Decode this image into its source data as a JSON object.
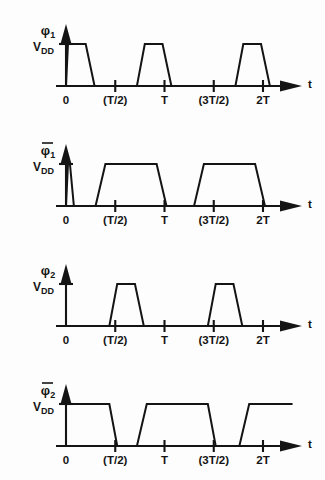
{
  "figure": {
    "stroke_color": "#141414",
    "background_color": "#fdfdfd"
  },
  "axis": {
    "time_axis_label": "t",
    "amplitude_label_main": "V",
    "amplitude_label_sub": "DD",
    "tick_labels": [
      "0",
      "(T/2)",
      "T",
      "(3T/2)",
      "2T"
    ],
    "tick_values": [
      0,
      0.5,
      1.0,
      1.5,
      2.0
    ],
    "x_min": 0,
    "x_max": 2.35,
    "y_min": 0,
    "y_max": 1
  },
  "chart_data": {
    "type": "line",
    "xlabel": "t",
    "ylabel": "V_DD",
    "x_tick_labels": [
      "0",
      "(T/2)",
      "T",
      "(3T/2)",
      "2T"
    ],
    "x_ticks": [
      0,
      0.5,
      1.0,
      1.5,
      2.0
    ],
    "xlim": [
      0,
      2.35
    ],
    "ylim": [
      0,
      1
    ],
    "grid": false,
    "legend": "none",
    "note": "Values are normalized: time in units of T, amplitude 0 = ground, 1 = V_DD. Waveforms are trapezoidal with finite rise and fall times.",
    "series": [
      {
        "name": "phi_1",
        "label": "φ",
        "subscript": "1",
        "overbar": false,
        "points": [
          [
            0.0,
            0.0
          ],
          [
            0.02,
            1.0
          ],
          [
            0.2,
            1.0
          ],
          [
            0.29,
            0.0
          ],
          [
            0.72,
            0.0
          ],
          [
            0.8,
            1.0
          ],
          [
            0.98,
            1.0
          ],
          [
            1.07,
            0.0
          ],
          [
            1.72,
            0.0
          ],
          [
            1.8,
            1.0
          ],
          [
            1.98,
            1.0
          ],
          [
            2.07,
            0.0
          ],
          [
            2.35,
            0.0
          ]
        ]
      },
      {
        "name": "phi_1_bar",
        "label": "φ",
        "subscript": "1",
        "overbar": true,
        "points": [
          [
            0.0,
            0.0
          ],
          [
            0.02,
            1.0
          ],
          [
            0.04,
            1.0
          ],
          [
            0.08,
            0.0
          ],
          [
            0.3,
            0.0
          ],
          [
            0.4,
            1.0
          ],
          [
            0.92,
            1.0
          ],
          [
            1.02,
            0.0
          ],
          [
            1.3,
            0.0
          ],
          [
            1.4,
            1.0
          ],
          [
            1.92,
            1.0
          ],
          [
            2.02,
            0.0
          ],
          [
            2.35,
            0.0
          ]
        ]
      },
      {
        "name": "phi_2",
        "label": "φ",
        "subscript": "2",
        "overbar": false,
        "points": [
          [
            0.0,
            0.0
          ],
          [
            0.44,
            0.0
          ],
          [
            0.52,
            1.0
          ],
          [
            0.7,
            1.0
          ],
          [
            0.79,
            0.0
          ],
          [
            1.44,
            0.0
          ],
          [
            1.52,
            1.0
          ],
          [
            1.7,
            1.0
          ],
          [
            1.79,
            0.0
          ],
          [
            2.35,
            0.0
          ]
        ]
      },
      {
        "name": "phi_2_bar",
        "label": "φ",
        "subscript": "2",
        "overbar": true,
        "points": [
          [
            0.0,
            1.0
          ],
          [
            0.44,
            1.0
          ],
          [
            0.52,
            0.0
          ],
          [
            0.72,
            0.0
          ],
          [
            0.82,
            1.0
          ],
          [
            1.44,
            1.0
          ],
          [
            1.52,
            0.0
          ],
          [
            1.76,
            0.0
          ],
          [
            1.86,
            1.0
          ],
          [
            2.3,
            1.0
          ]
        ]
      }
    ]
  }
}
